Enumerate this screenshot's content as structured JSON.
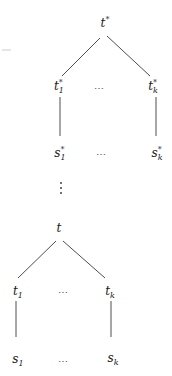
{
  "diagram": {
    "type": "tree-derivation",
    "upper_tree": {
      "root": {
        "base": "t",
        "sup": "*"
      },
      "children": [
        {
          "base": "t",
          "sub": "1",
          "sup": "*"
        },
        {
          "ellipsis": "⋯"
        },
        {
          "base": "t",
          "sub": "k",
          "sup": "*"
        }
      ],
      "leaves": [
        {
          "base": "s",
          "sub": "1",
          "sup": "*"
        },
        {
          "ellipsis": "⋯"
        },
        {
          "base": "s",
          "sub": "k",
          "sup": "*"
        }
      ]
    },
    "connector": {
      "symbol": "⋮"
    },
    "lower_tree": {
      "root": {
        "base": "t"
      },
      "children": [
        {
          "base": "t",
          "sub": "1"
        },
        {
          "ellipsis": "⋯"
        },
        {
          "base": "t",
          "sub": "k"
        }
      ],
      "leaves": [
        {
          "base": "s",
          "sub": "1"
        },
        {
          "ellipsis": "⋯"
        },
        {
          "base": "s",
          "sub": "k"
        }
      ]
    },
    "colors": {
      "edge": "#3a3a3a",
      "text": "#1a1a1a",
      "background": "#ffffff"
    }
  }
}
